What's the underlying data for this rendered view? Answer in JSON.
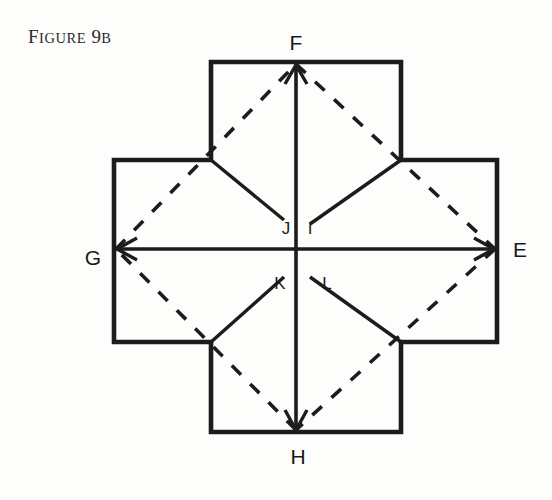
{
  "figure": {
    "caption_prefix": "F",
    "caption_word": "IGURE",
    "caption_number": " 9",
    "caption_suffix": "B",
    "caption_full": "FIGURE 9B",
    "background_color": "#fdfdfc",
    "ink_color": "#1c1c1c"
  },
  "labels": {
    "F": "F",
    "G": "G",
    "E": "E",
    "H": "H",
    "J": "J",
    "I": "I",
    "K": "K",
    "L": "L"
  },
  "geometry": {
    "shape": "greek-cross",
    "center": {
      "x": 296,
      "y": 249
    },
    "cross_outer": {
      "top": 62,
      "bottom": 432,
      "left": 114,
      "right": 497,
      "arm_left": 211,
      "arm_right": 401,
      "arm_top": 160,
      "arm_bottom": 342
    },
    "vertices": {
      "F": {
        "x": 296,
        "y": 62
      },
      "H": {
        "x": 296,
        "y": 432
      },
      "G": {
        "x": 114,
        "y": 249
      },
      "E": {
        "x": 497,
        "y": 249
      },
      "notch_top_left": {
        "x": 211,
        "y": 160
      },
      "notch_top_right": {
        "x": 401,
        "y": 160
      },
      "notch_bottom_left": {
        "x": 211,
        "y": 342
      },
      "notch_bottom_right": {
        "x": 401,
        "y": 342
      }
    },
    "fold_endpoints": {
      "J": {
        "x": 283,
        "y": 219
      },
      "I": {
        "x": 311,
        "y": 219
      },
      "K": {
        "x": 283,
        "y": 279
      },
      "L": {
        "x": 311,
        "y": 279
      }
    }
  },
  "annotations": {
    "arrows": [
      {
        "name": "arrow-F",
        "direction": "up",
        "tip_label": "F"
      },
      {
        "name": "arrow-H",
        "direction": "down",
        "tip_label": "H"
      },
      {
        "name": "arrow-G",
        "direction": "left",
        "tip_label": "G"
      },
      {
        "name": "arrow-E",
        "direction": "right",
        "tip_label": "E"
      }
    ],
    "dashed_diamond": [
      "F",
      "E",
      "H",
      "G"
    ],
    "solid_folds": [
      "notch-to-J",
      "notch-to-I",
      "notch-to-K",
      "notch-to-L"
    ]
  }
}
